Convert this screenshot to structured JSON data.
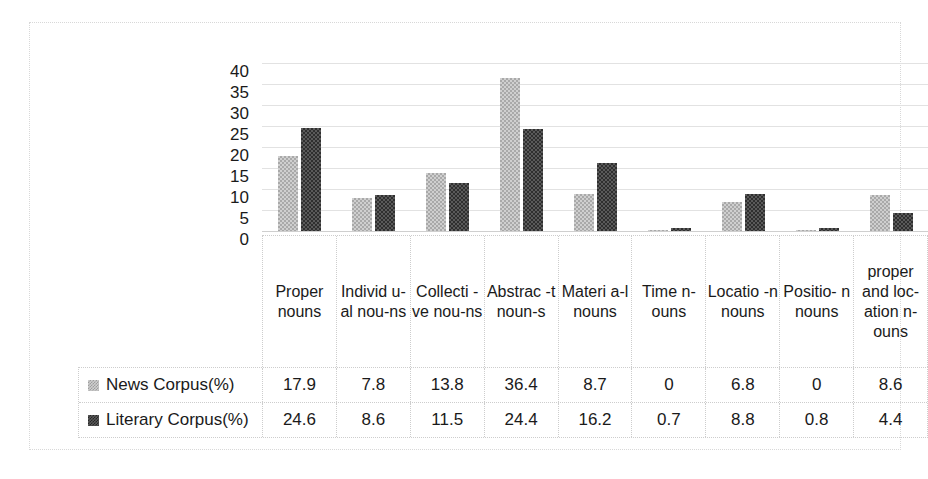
{
  "chart_data": {
    "type": "bar",
    "title": "",
    "xlabel": "",
    "ylabel": "",
    "ylim": [
      0,
      40
    ],
    "ytick_step": 5,
    "yticks": [
      "40",
      "35",
      "30",
      "25",
      "20",
      "15",
      "10",
      "5",
      "0"
    ],
    "grid": true,
    "legend_position": "bottom-table",
    "categories": [
      "Proper nouns",
      "Individ u-al nou-ns",
      "Collecti -ve nou-ns",
      "Abstrac -t noun-s",
      "Materi a-l nouns",
      "Time n- ouns",
      "Locatio -n nouns",
      "Positio- n nouns",
      "proper and loc- ation n- ouns"
    ],
    "series": [
      {
        "name": "News Corpus(%)",
        "color": "#cfcfcf",
        "values": [
          17.9,
          7.8,
          13.8,
          36.4,
          8.7,
          0,
          6.8,
          0,
          8.6
        ],
        "display": [
          "17.9",
          "7.8",
          "13.8",
          "36.4",
          "8.7",
          "0",
          "6.8",
          "0",
          "8.6"
        ]
      },
      {
        "name": "Literary Corpus(%)",
        "color": "#5a5a5a",
        "values": [
          24.6,
          8.6,
          11.5,
          24.4,
          16.2,
          0.7,
          8.8,
          0.8,
          4.4
        ],
        "display": [
          "24.6",
          "8.6",
          "11.5",
          "24.4",
          "16.2",
          "0.7",
          "8.8",
          "0.8",
          "4.4"
        ]
      }
    ]
  }
}
